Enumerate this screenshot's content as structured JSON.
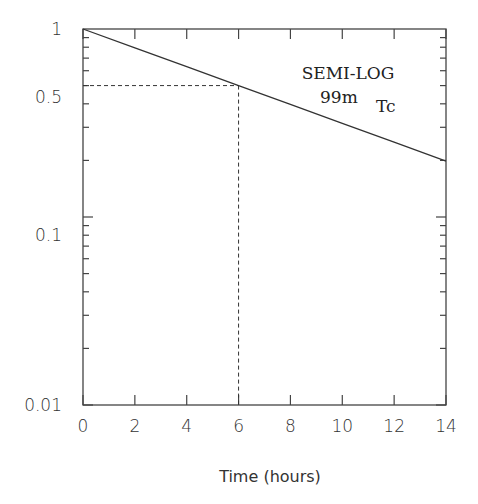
{
  "chart_data": {
    "type": "line",
    "title": "",
    "annotation": {
      "line1": "SEMI-LOG",
      "isotope_mass": "99m",
      "isotope_symbol": "Tc"
    },
    "xlabel": "Time (hours)",
    "ylabel": "",
    "xlim": [
      0,
      14
    ],
    "ylim": [
      0.01,
      1
    ],
    "yscale": "log",
    "grid": false,
    "legend": null,
    "x_ticks": [
      "0",
      "2",
      "4",
      "6",
      "8",
      "10",
      "12",
      "14"
    ],
    "y_ticks": [
      "1",
      "0.5",
      "0.1",
      "0.01"
    ],
    "series": [
      {
        "name": "99mTc decay",
        "style": "solid",
        "x": [
          0,
          2,
          4,
          6,
          8,
          10,
          12,
          14
        ],
        "y": [
          1.0,
          0.794,
          0.63,
          0.5,
          0.397,
          0.315,
          0.25,
          0.198
        ]
      }
    ],
    "guides": [
      {
        "style": "dashed",
        "from": [
          0,
          0.5
        ],
        "to": [
          6,
          0.5
        ]
      },
      {
        "style": "dashed",
        "from": [
          6,
          0.5
        ],
        "to": [
          6,
          0.01
        ]
      }
    ],
    "half_life_hours": 6
  }
}
